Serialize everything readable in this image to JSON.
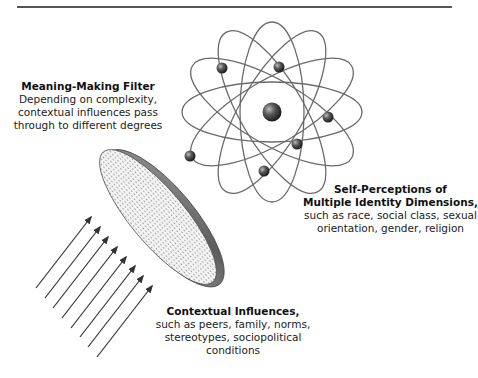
{
  "diagram": {
    "filter": {
      "title": "Meaning-Making Filter",
      "lines": [
        "Depending on complexity,",
        "contextual influences pass",
        "through to different degrees"
      ]
    },
    "self_perceptions": {
      "title_line1": "Self-Perceptions of",
      "title_line2": "Multiple Identity Dimensions,",
      "lines": [
        "such as race, social class, sexual",
        "orientation, gender, religion"
      ]
    },
    "contextual_influences": {
      "title": "Contextual Influences,",
      "lines": [
        "such as peers, family, norms,",
        "stereotypes, sociopolitical",
        "conditions"
      ]
    },
    "elements": {
      "atom": "atom-icon",
      "filter_disc": "filter-disc-icon",
      "arrows": "influence-arrows-icon",
      "arrow_count": 8,
      "electron_count": 6
    },
    "colors": {
      "line": "#555555",
      "text": "#222222",
      "sphere": "#4a4a4a",
      "disc_rim": "#6b6b6b",
      "background": "#ffffff"
    }
  }
}
